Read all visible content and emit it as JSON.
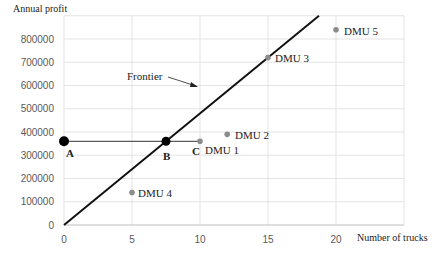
{
  "chart_data": {
    "type": "scatter",
    "title": "",
    "xlabel": "Number of trucks",
    "ylabel": "Annual profit",
    "xlim": [
      0,
      25
    ],
    "ylim": [
      0,
      900000
    ],
    "xticks": [
      0,
      5,
      10,
      15,
      20
    ],
    "yticks": [
      0,
      100000,
      200000,
      300000,
      400000,
      500000,
      600000,
      700000,
      800000
    ],
    "ytick_labels": [
      "0",
      "100000",
      "200000",
      "300000",
      "400000",
      "500000",
      "600000",
      "700000",
      "800000"
    ],
    "xtick_labels": [
      "0",
      "5",
      "10",
      "15",
      "20"
    ],
    "grid": true,
    "series": [
      {
        "name": "DMUs",
        "points": [
          {
            "label": "DMU 1",
            "x": 10,
            "y": 360000
          },
          {
            "label": "DMU 2",
            "x": 12,
            "y": 390000
          },
          {
            "label": "DMU 3",
            "x": 15,
            "y": 720000
          },
          {
            "label": "DMU 4",
            "x": 5,
            "y": 140000
          },
          {
            "label": "DMU 5",
            "x": 20,
            "y": 840000
          }
        ]
      },
      {
        "name": "Reference points",
        "points": [
          {
            "label": "A",
            "x": 0,
            "y": 360000
          },
          {
            "label": "B",
            "x": 7.5,
            "y": 360000
          },
          {
            "label": "C",
            "x": 10,
            "y": 360000
          }
        ]
      }
    ],
    "lines": [
      {
        "name": "Frontier",
        "from": [
          0,
          0
        ],
        "to": [
          18.75,
          900000
        ]
      },
      {
        "name": "A-C reference line",
        "from": [
          0,
          360000
        ],
        "to": [
          10,
          360000
        ]
      }
    ],
    "annotations": [
      {
        "text": "Frontier",
        "arrow_to": [
          9.6,
          460000
        ]
      }
    ]
  },
  "labels": {
    "ylabel": "Annual profit",
    "xlabel": "Number of trucks",
    "frontier": "Frontier",
    "A": "A",
    "B": "B",
    "C": "C",
    "dmu1": "DMU 1",
    "dmu2": "DMU 2",
    "dmu3": "DMU 3",
    "dmu4": "DMU 4",
    "dmu5": "DMU 5"
  }
}
